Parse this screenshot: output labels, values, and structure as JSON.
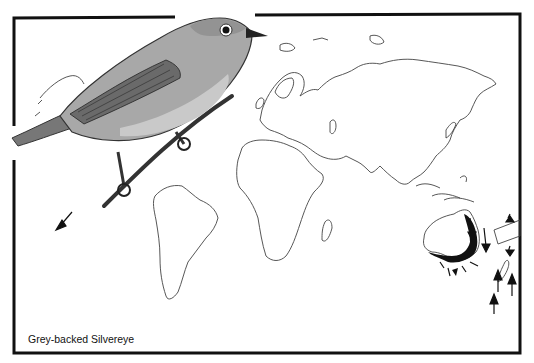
{
  "caption": "Grey-backed Silvereye",
  "colors": {
    "frame": "#111111",
    "coast": "#444444",
    "range_fill": "#111111",
    "bird_shade": "#8a8a8a",
    "background": "#ffffff"
  },
  "map": {
    "continents": [
      "north-america",
      "south-america",
      "europe",
      "africa",
      "asia",
      "australia",
      "new-zealand",
      "greenland"
    ],
    "range_region": "eastern-southern-australia",
    "migration_arrows": 12
  },
  "illustration": {
    "subject": "bird-perched-on-twig"
  }
}
